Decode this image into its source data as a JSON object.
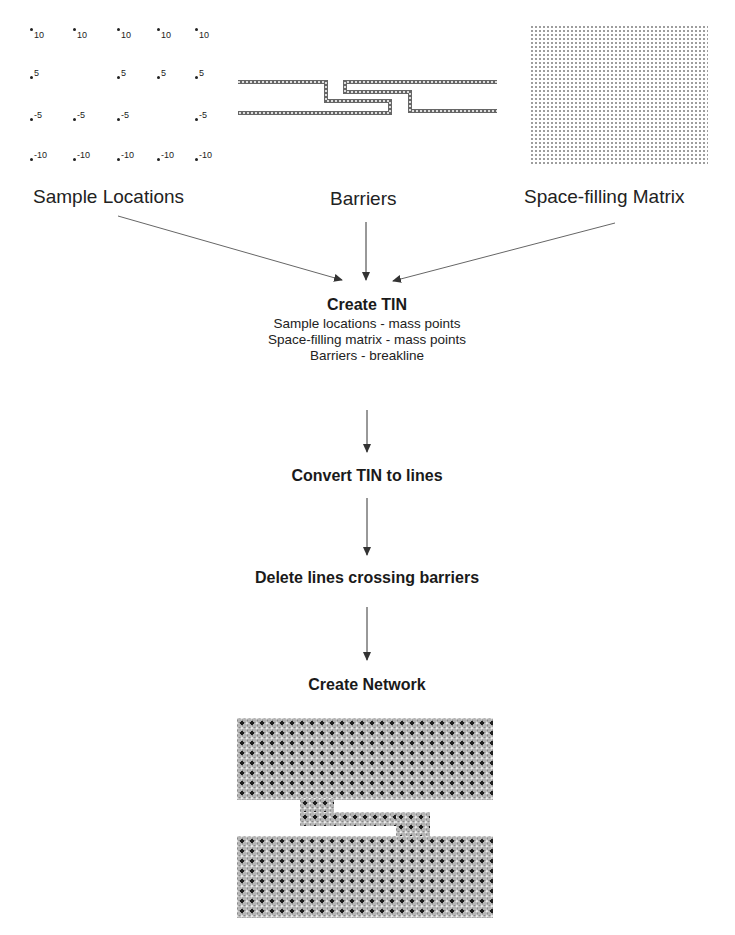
{
  "inputs": {
    "sample_locations": {
      "label": "Sample Locations",
      "points": [
        {
          "row": 0,
          "values": [
            "10",
            "10",
            "10",
            "10",
            "10"
          ]
        },
        {
          "row": 1,
          "values": [
            "5",
            "",
            "5",
            "5",
            "5"
          ]
        },
        {
          "row": 2,
          "values": [
            "-5",
            "-5",
            "-5",
            "",
            "-5"
          ]
        },
        {
          "row": 3,
          "values": [
            "-10",
            "-10",
            "-10",
            "-10",
            "-10"
          ]
        }
      ]
    },
    "barriers": {
      "label": "Barriers"
    },
    "space_filling_matrix": {
      "label": "Space-filling Matrix"
    }
  },
  "steps": [
    {
      "title": "Create TIN",
      "details": [
        "Sample locations - mass points",
        "Space-filling matrix - mass points",
        "Barriers - breakline"
      ]
    },
    {
      "title": "Convert TIN to lines"
    },
    {
      "title": "Delete lines crossing barriers"
    },
    {
      "title": "Create Network"
    }
  ],
  "colors": {
    "arrow": "#333333",
    "barrier": "#555555",
    "network_fill": "#b5b5b5"
  }
}
